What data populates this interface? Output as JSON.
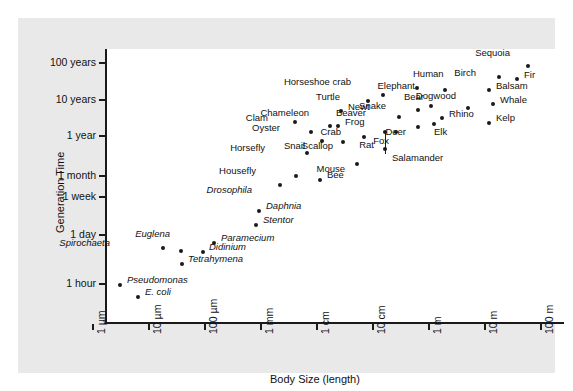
{
  "figure": {
    "background": "#e9e9e9",
    "plot_background": "#ffffff",
    "axis_color": "#1a1a1a",
    "point_color": "#1a1a1a"
  },
  "chart_data": {
    "type": "scatter",
    "title": "",
    "xlabel": "Body Size (length)",
    "ylabel": "Generation Time",
    "grid": false,
    "legend": null,
    "x_scale": "log",
    "y_scale": "log",
    "x_ticks": [
      "1 µm",
      "10 µm",
      "100 µm",
      "1 mm",
      "1 cm",
      "10 cm",
      "1 m",
      "10 m",
      "100 m"
    ],
    "y_ticks": [
      "100 years",
      "10 years",
      "1 year",
      "1 month",
      "1 week",
      "1 day",
      "1 hour"
    ],
    "xlim": [
      "1 µm",
      "100 m"
    ],
    "ylim": [
      "below 1 hour",
      "above 100 years"
    ],
    "points": [
      {
        "label": "E. coli",
        "italic": true,
        "x": 138,
        "y": 297,
        "lx": 145,
        "ly": 292
      },
      {
        "label": "Pseudomonas",
        "italic": true,
        "x": 120,
        "y": 285,
        "lx": 127,
        "ly": 280
      },
      {
        "label": "Tetrahymena",
        "italic": true,
        "x": 182,
        "y": 264,
        "lx": 188,
        "ly": 259
      },
      {
        "label": "Didinium",
        "italic": true,
        "x": 203,
        "y": 252,
        "lx": 209,
        "ly": 247
      },
      {
        "label": "Spirochaeta",
        "italic": true,
        "x": 163,
        "y": 248,
        "lx": 110,
        "ly": 243
      },
      {
        "label": "Euglena",
        "italic": true,
        "x": 181,
        "y": 251,
        "lx": 170,
        "ly": 234
      },
      {
        "label": "Paramecium",
        "italic": true,
        "x": 214,
        "y": 243,
        "lx": 221,
        "ly": 238
      },
      {
        "label": "Stentor",
        "italic": true,
        "x": 256,
        "y": 225,
        "lx": 263,
        "ly": 220
      },
      {
        "label": "Daphnia",
        "italic": true,
        "x": 259,
        "y": 211,
        "lx": 266,
        "ly": 206
      },
      {
        "label": "Drosophila",
        "italic": true,
        "x": 280,
        "y": 185,
        "lx": 252,
        "ly": 190
      },
      {
        "label": "Housefly",
        "italic": false,
        "x": 296,
        "y": 176,
        "lx": 256,
        "ly": 171
      },
      {
        "label": "Bee",
        "italic": false,
        "x": 320,
        "y": 180,
        "lx": 327,
        "ly": 175
      },
      {
        "label": "Mouse",
        "italic": false,
        "x": 357,
        "y": 164,
        "lx": 345,
        "ly": 169
      },
      {
        "label": "Horsefly",
        "italic": false,
        "x": 307,
        "y": 153,
        "lx": 265,
        "ly": 148
      },
      {
        "label": "Rat",
        "italic": false,
        "x": 385,
        "y": 149,
        "lx": 374,
        "ly": 145
      },
      {
        "label": "Snail",
        "italic": false,
        "x": 322,
        "y": 141,
        "lx": 305,
        "ly": 146
      },
      {
        "label": "Scallop",
        "italic": false,
        "x": 343,
        "y": 142,
        "lx": 333,
        "ly": 146
      },
      {
        "label": "Crab",
        "italic": false,
        "x": 364,
        "y": 137,
        "lx": 341,
        "ly": 132
      },
      {
        "label": "Oyster",
        "italic": false,
        "x": 311,
        "y": 132,
        "lx": 280,
        "ly": 128
      },
      {
        "label": "Fox",
        "italic": false,
        "x": 396,
        "y": 132,
        "lx": 389,
        "ly": 141
      },
      {
        "label": "Salamander",
        "italic": false,
        "x": 385,
        "y": 132,
        "lx": 392,
        "ly": 158
      },
      {
        "label": "Clam",
        "italic": false,
        "x": 295,
        "y": 122,
        "lx": 268,
        "ly": 118
      },
      {
        "label": "Frog",
        "italic": false,
        "x": 338,
        "y": 126,
        "lx": 345,
        "ly": 122
      },
      {
        "label": "Deer",
        "italic": false,
        "x": 418,
        "y": 127,
        "lx": 406,
        "ly": 132
      },
      {
        "label": "Elk",
        "italic": false,
        "x": 434,
        "y": 124,
        "lx": 434,
        "ly": 132
      },
      {
        "label": "Chameleon",
        "italic": false,
        "x": 330,
        "y": 126,
        "lx": 309,
        "ly": 113
      },
      {
        "label": "Rhino",
        "italic": false,
        "x": 442,
        "y": 118,
        "lx": 449,
        "ly": 114
      },
      {
        "label": "Beaver",
        "italic": false,
        "x": 399,
        "y": 117,
        "lx": 366,
        "ly": 113
      },
      {
        "label": "Kelp",
        "italic": false,
        "x": 489,
        "y": 123,
        "lx": 496,
        "ly": 118
      },
      {
        "label": "Newt",
        "italic": false,
        "x": 341,
        "y": 111,
        "lx": 348,
        "ly": 107
      },
      {
        "label": "Snake",
        "italic": false,
        "x": 418,
        "y": 110,
        "lx": 386,
        "ly": 106
      },
      {
        "label": "Bear",
        "italic": false,
        "x": 431,
        "y": 106,
        "lx": 424,
        "ly": 97
      },
      {
        "label": "Turtle",
        "italic": false,
        "x": 368,
        "y": 101,
        "lx": 340,
        "ly": 97
      },
      {
        "label": "Whale",
        "italic": false,
        "x": 493,
        "y": 104,
        "lx": 500,
        "ly": 100
      },
      {
        "label": "Dogwood",
        "italic": false,
        "x": 468,
        "y": 108,
        "lx": 456,
        "ly": 96
      },
      {
        "label": "Elephant",
        "italic": false,
        "x": 445,
        "y": 90,
        "lx": 415,
        "ly": 86
      },
      {
        "label": "Balsam",
        "italic": false,
        "x": 489,
        "y": 90,
        "lx": 496,
        "ly": 86
      },
      {
        "label": "Horseshoe crab",
        "italic": false,
        "x": 383,
        "y": 95,
        "lx": 351,
        "ly": 82
      },
      {
        "label": "Human",
        "italic": false,
        "x": 417,
        "y": 88,
        "lx": 413,
        "ly": 74
      },
      {
        "label": "Birch",
        "italic": false,
        "x": 499,
        "y": 77,
        "lx": 476,
        "ly": 73
      },
      {
        "label": "Fir",
        "italic": false,
        "x": 517,
        "y": 79,
        "lx": 524,
        "ly": 75
      },
      {
        "label": "Sequoia",
        "italic": false,
        "x": 528,
        "y": 66,
        "lx": 510,
        "ly": 53
      }
    ]
  }
}
